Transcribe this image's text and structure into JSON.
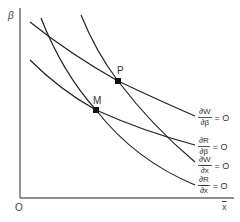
{
  "diagram": {
    "axes": {
      "y_label": "β",
      "x_label": "x",
      "x_label_overline": true,
      "origin_label": "O"
    },
    "points": [
      {
        "id": "P",
        "label": "P",
        "x": 118,
        "y": 81
      },
      {
        "id": "M",
        "label": "M",
        "x": 96,
        "y": 110
      }
    ],
    "curves": [
      {
        "id": "dW_dbeta",
        "numerator": "∂W",
        "denominator": "∂β",
        "den_overline": false,
        "equals": "= O"
      },
      {
        "id": "dR_dbeta",
        "numerator": "∂R",
        "denominator": "∂β",
        "den_overline": false,
        "equals": "= O"
      },
      {
        "id": "dW_dxbar",
        "numerator": "∂W",
        "denominator": "∂x",
        "den_overline": true,
        "equals": "= O"
      },
      {
        "id": "dR_dxbar",
        "numerator": "∂R",
        "denominator": "∂x",
        "den_overline": true,
        "equals": "= O"
      }
    ],
    "colors": {
      "axis": "#6a6a6a",
      "curve": "#222222",
      "point": "#111111"
    }
  }
}
